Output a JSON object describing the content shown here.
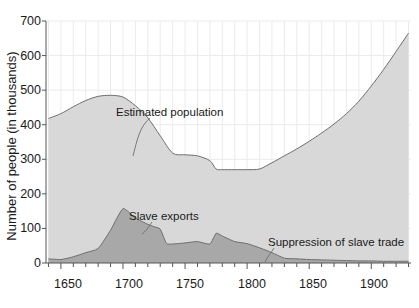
{
  "chart_data": {
    "type": "area",
    "title": "",
    "xlabel": "",
    "ylabel": "Number of people (in thousands)",
    "xlim": [
      1638,
      1932
    ],
    "ylim": [
      0,
      700
    ],
    "grid": true,
    "grid_note": "faint horizontal gridlines at every 100; faint vertical gridlines every 10 years",
    "legend_position": "inline annotations",
    "xticks": [
      1650,
      1700,
      1750,
      1800,
      1850,
      1900
    ],
    "xtick_labels": [
      "1650",
      "1700",
      "1750",
      "1800",
      "1850",
      "1900"
    ],
    "xminor_step": 10,
    "yticks": [
      0,
      100,
      200,
      300,
      400,
      500,
      600,
      700
    ],
    "ytick_labels": [
      "0",
      "100",
      "200",
      "300",
      "400",
      "500",
      "600",
      "700"
    ],
    "colors": {
      "population_fill": "#d8d8d8",
      "exports_fill": "#a8a8a8",
      "line": "#6e6e6e",
      "axis": "#555555",
      "grid": "#ebebeb",
      "text": "#1a1a1a"
    },
    "series": [
      {
        "name": "Estimated population",
        "fill": "#d8d8d8",
        "x": [
          1640,
          1650,
          1660,
          1670,
          1680,
          1690,
          1700,
          1710,
          1720,
          1730,
          1740,
          1750,
          1760,
          1770,
          1775,
          1780,
          1790,
          1800,
          1810,
          1820,
          1830,
          1840,
          1850,
          1860,
          1870,
          1880,
          1890,
          1900,
          1910,
          1920,
          1930
        ],
        "values": [
          418,
          432,
          452,
          470,
          482,
          485,
          480,
          455,
          420,
          368,
          318,
          313,
          310,
          296,
          272,
          270,
          270,
          270,
          272,
          290,
          310,
          330,
          352,
          376,
          402,
          432,
          468,
          512,
          560,
          612,
          665
        ]
      },
      {
        "name": "Slave exports",
        "fill": "#a8a8a8",
        "x": [
          1640,
          1650,
          1660,
          1670,
          1680,
          1690,
          1700,
          1710,
          1720,
          1725,
          1730,
          1735,
          1740,
          1750,
          1760,
          1770,
          1775,
          1780,
          1790,
          1800,
          1810,
          1820,
          1830,
          1840,
          1850,
          1860,
          1870,
          1880,
          1890,
          1900,
          1910,
          1920,
          1930
        ],
        "values": [
          12,
          10,
          18,
          30,
          42,
          95,
          157,
          130,
          112,
          105,
          98,
          57,
          55,
          58,
          62,
          55,
          86,
          78,
          62,
          56,
          44,
          30,
          14,
          12,
          10,
          9,
          8,
          7,
          6,
          6,
          5,
          5,
          5
        ]
      }
    ],
    "annotations": [
      {
        "text": "Estimated population",
        "x": 1740,
        "y": 430
      },
      {
        "text": "Slave exports",
        "x": 1720,
        "y": 160
      },
      {
        "text": "Suppression of slave trade",
        "x": 1855,
        "y": 62
      }
    ]
  },
  "labels": {
    "ylabel": "Number of people (in thousands)",
    "annotation_population": "Estimated population",
    "annotation_exports": "Slave exports",
    "annotation_suppression": "Suppression of slave trade",
    "y0": "0",
    "y100": "100",
    "y200": "200",
    "y300": "300",
    "y400": "400",
    "y500": "500",
    "y600": "600",
    "y700": "700",
    "x1650": "1650",
    "x1700": "1700",
    "x1750": "1750",
    "x1800": "1800",
    "x1850": "1850",
    "x1900": "1900"
  }
}
